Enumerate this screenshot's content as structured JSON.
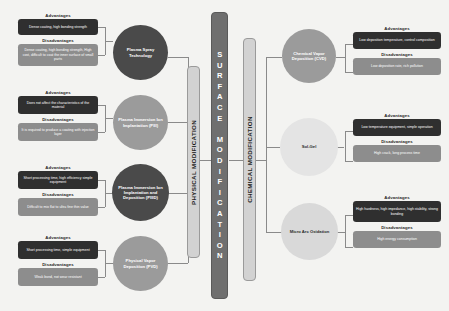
{
  "diagram": {
    "center_bar": {
      "label": "SURFACE MODIFICATION"
    },
    "branches": {
      "physical": {
        "label": "PHYSICAL MODIFICATION"
      },
      "chemical": {
        "label": "CHEMICAL MODIFICATION"
      }
    },
    "labels": {
      "advantages": "Advantages",
      "disadvantages": "Disadvantages"
    },
    "physical_methods": [
      {
        "name": "Plasma Spray Technology",
        "advantages": "Dense coating, high bonding strength",
        "disadvantages": "Dense coating, high bonding strength, High cost, difficult to coat the inner surface of small parts"
      },
      {
        "name": "Plasma Immersion Ion Implantation (PIII)",
        "advantages": "Does not affect the characteristics of the material",
        "disadvantages": "It is required to produce a coating with injection layer"
      },
      {
        "name": "Plasma Immersion Ion Implantation and Deposition (PIIID)",
        "advantages": "Short processing time, high efficiency simple equipment",
        "disadvantages": "Difficult to mix flat to ultra fine thin value"
      },
      {
        "name": "Physical Vapor Deposition (PVD)",
        "advantages": "Short processing time, simple equipment",
        "disadvantages": "Weak bond, not wear resistant"
      }
    ],
    "chemical_methods": [
      {
        "name": "Chemical Vapor Deposition (CVD)",
        "advantages": "Low deposition temperature, control composition",
        "disadvantages": "Low deposition rate, rich pollution"
      },
      {
        "name": "Sol-Gel",
        "advantages": "Low temperature equipment, simple operation",
        "disadvantages": "High crack, long process time"
      },
      {
        "name": "Micro Arc Oxidation",
        "advantages": "High hardness, high impedance, high stability, strong bonding",
        "disadvantages": "High energy consumption"
      }
    ],
    "colors": {
      "background": "#f3f3f1",
      "box_dark": "#2f2f2f",
      "box_gray": "#8d8d8d",
      "center_bar": "#6f6f6f",
      "branch_bar": "#d2d2d2",
      "connector": "#8a8a8a"
    }
  }
}
